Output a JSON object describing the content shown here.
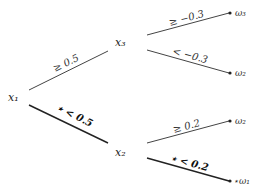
{
  "diagram": {
    "type": "decision-tree",
    "nodes": {
      "root": "x₁",
      "upper": "x₃",
      "lower": "x₂"
    },
    "leaves": {
      "upper_top": "ω₃",
      "upper_bottom": "ω₂",
      "lower_top": "ω₂",
      "lower_bottom": "⋆ω₁"
    },
    "edges": {
      "root_upper": {
        "label": "≥ 0.5",
        "highlighted": false
      },
      "root_lower": {
        "label": "⋆ < 0.5",
        "highlighted": true
      },
      "upper_top": {
        "label": "≥ −0.3",
        "highlighted": false
      },
      "upper_bottom": {
        "label": "< −0.3",
        "highlighted": false
      },
      "lower_top": {
        "label": "≥ 0.2",
        "highlighted": false
      },
      "lower_bottom": {
        "label": "⋆ < 0.2",
        "highlighted": true
      }
    }
  }
}
